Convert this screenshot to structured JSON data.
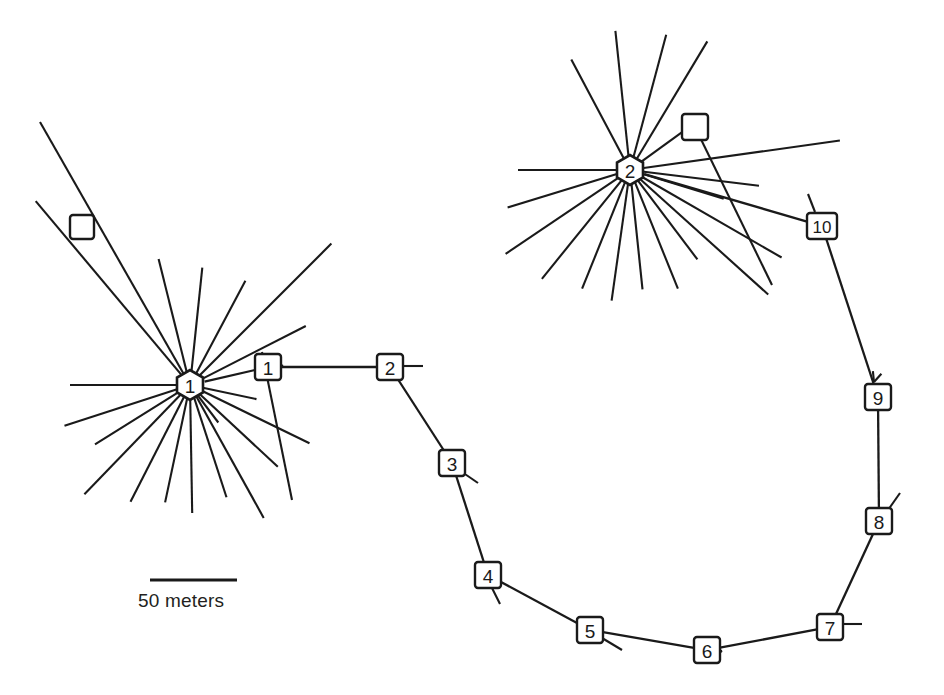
{
  "figure": {
    "type": "network-diagram",
    "background_color": "#ffffff",
    "line_color": "#1a1a1a",
    "width": 944,
    "height": 695
  },
  "scale": {
    "caption": "50 meters",
    "bar_length_px": 87,
    "bar_x1": 150,
    "bar_x2": 237,
    "bar_y": 580
  },
  "hubs": [
    {
      "id": "hub-1",
      "label": "1",
      "cx": 190,
      "cy": 385,
      "r": 15,
      "spoke_count": 19
    },
    {
      "id": "hub-2",
      "label": "2",
      "cx": 630,
      "cy": 170,
      "r": 15,
      "spoke_count": 19
    }
  ],
  "boxes": [
    {
      "id": "box-1",
      "label": "1",
      "cx": 268,
      "cy": 367,
      "w": 26,
      "h": 26
    },
    {
      "id": "box-2",
      "label": "2",
      "cx": 390,
      "cy": 367,
      "w": 26,
      "h": 26
    },
    {
      "id": "box-3",
      "label": "3",
      "cx": 452,
      "cy": 463,
      "w": 26,
      "h": 26
    },
    {
      "id": "box-4",
      "label": "4",
      "cx": 488,
      "cy": 575,
      "w": 26,
      "h": 26
    },
    {
      "id": "box-5",
      "label": "5",
      "cx": 590,
      "cy": 630,
      "w": 26,
      "h": 26
    },
    {
      "id": "box-6",
      "label": "6",
      "cx": 707,
      "cy": 650,
      "w": 26,
      "h": 26
    },
    {
      "id": "box-7",
      "label": "7",
      "cx": 830,
      "cy": 627,
      "w": 26,
      "h": 26
    },
    {
      "id": "box-8",
      "label": "8",
      "cx": 879,
      "cy": 521,
      "w": 26,
      "h": 26
    },
    {
      "id": "box-9",
      "label": "9",
      "cx": 878,
      "cy": 397,
      "w": 26,
      "h": 26
    },
    {
      "id": "box-10",
      "label": "10",
      "cx": 822,
      "cy": 226,
      "w": 30,
      "h": 26
    }
  ],
  "empty_boxes": [
    {
      "id": "empty-box-left",
      "label": "",
      "cx": 82,
      "cy": 227,
      "w": 24,
      "h": 24
    },
    {
      "id": "empty-box-right",
      "label": "",
      "cx": 695,
      "cy": 127,
      "w": 26,
      "h": 26
    }
  ],
  "chain_edges": [
    {
      "from": "box-1",
      "to": "box-2"
    },
    {
      "from": "box-2",
      "to": "box-3"
    },
    {
      "from": "box-3",
      "to": "box-4"
    },
    {
      "from": "box-4",
      "to": "box-5"
    },
    {
      "from": "box-5",
      "to": "box-6"
    },
    {
      "from": "box-6",
      "to": "box-7"
    },
    {
      "from": "box-7",
      "to": "box-8"
    },
    {
      "from": "box-8",
      "to": "box-9"
    },
    {
      "from": "box-9",
      "to": "box-10"
    },
    {
      "from": "hub-1",
      "to": "box-1"
    },
    {
      "from": "hub-2",
      "to": "box-10"
    }
  ],
  "hub1_spokes": [
    {
      "angle_deg": 180.0,
      "length": 120
    },
    {
      "angle_deg": 198.0,
      "length": 132
    },
    {
      "angle_deg": 212.0,
      "length": 112
    },
    {
      "angle_deg": 226.0,
      "length": 152
    },
    {
      "angle_deg": 243.0,
      "length": 131
    },
    {
      "angle_deg": 258.0,
      "length": 120
    },
    {
      "angle_deg": 271.0,
      "length": 128
    },
    {
      "angle_deg": 288.0,
      "length": 118
    },
    {
      "angle_deg": 299.0,
      "length": 152
    },
    {
      "angle_deg": 307.0,
      "length": 47
    },
    {
      "angle_deg": 317.0,
      "length": 120
    },
    {
      "angle_deg": 334.0,
      "length": 133
    },
    {
      "angle_deg": 348.0,
      "length": 68
    },
    {
      "angle_deg": 27.0,
      "length": 130
    },
    {
      "angle_deg": 45.0,
      "length": 200
    },
    {
      "angle_deg": 62.0,
      "length": 118
    },
    {
      "angle_deg": 84.0,
      "length": 118
    },
    {
      "angle_deg": 104.0,
      "length": 130
    },
    {
      "angle_deg": 130.0,
      "length": 240
    }
  ],
  "hub2_spokes": [
    {
      "angle_deg": 180.0,
      "length": 112
    },
    {
      "angle_deg": 197.0,
      "length": 128
    },
    {
      "angle_deg": 214.0,
      "length": 150
    },
    {
      "angle_deg": 231.0,
      "length": 140
    },
    {
      "angle_deg": 248.0,
      "length": 128
    },
    {
      "angle_deg": 262.0,
      "length": 132
    },
    {
      "angle_deg": 276.0,
      "length": 120
    },
    {
      "angle_deg": 292.0,
      "length": 128
    },
    {
      "angle_deg": 307.0,
      "length": 112
    },
    {
      "angle_deg": 318.0,
      "length": 186
    },
    {
      "angle_deg": 330.0,
      "length": 175
    },
    {
      "angle_deg": 343.0,
      "length": 98
    },
    {
      "angle_deg": 353.0,
      "length": 130
    },
    {
      "angle_deg": 8.0,
      "length": 212
    },
    {
      "angle_deg": 36.0,
      "length": 95
    },
    {
      "angle_deg": 59.0,
      "length": 150
    },
    {
      "angle_deg": 75.0,
      "length": 140
    },
    {
      "angle_deg": 96.0,
      "length": 140
    },
    {
      "angle_deg": 118.0,
      "length": 125
    }
  ],
  "stubs": [
    {
      "id": "stub-box2",
      "x1": 403,
      "y1": 366,
      "x2": 423,
      "y2": 366
    },
    {
      "id": "stub-box3",
      "x1": 462,
      "y1": 472,
      "x2": 478,
      "y2": 483
    },
    {
      "id": "stub-box4",
      "x1": 492,
      "y1": 588,
      "x2": 500,
      "y2": 604
    },
    {
      "id": "stub-box5",
      "x1": 602,
      "y1": 638,
      "x2": 622,
      "y2": 650
    },
    {
      "id": "stub-box7",
      "x1": 843,
      "y1": 624,
      "x2": 862,
      "y2": 624
    },
    {
      "id": "stub-box8",
      "x1": 888,
      "y1": 510,
      "x2": 900,
      "y2": 493
    },
    {
      "id": "stub-box10",
      "x1": 815,
      "y1": 212,
      "x2": 808,
      "y2": 194
    }
  ],
  "arrows": [
    {
      "id": "arrow-to-box1",
      "tip_x": 283,
      "tip_y": 366,
      "angle_deg": 180
    },
    {
      "id": "arrow-to-box6",
      "tip_x": 722,
      "tip_y": 651,
      "angle_deg": 192
    },
    {
      "id": "arrow-to-box9",
      "tip_x": 874,
      "tip_y": 382,
      "angle_deg": 72
    }
  ],
  "long_lines": [
    {
      "id": "long-line-upper-left",
      "x1": 40,
      "y1": 122,
      "x2": 190,
      "y2": 385
    },
    {
      "id": "long-line-box1-down",
      "x1": 262,
      "y1": 352,
      "x2": 292,
      "y2": 500
    },
    {
      "id": "long-line-hub2-box",
      "x1": 695,
      "y1": 127,
      "x2": 772,
      "y2": 285
    }
  ]
}
